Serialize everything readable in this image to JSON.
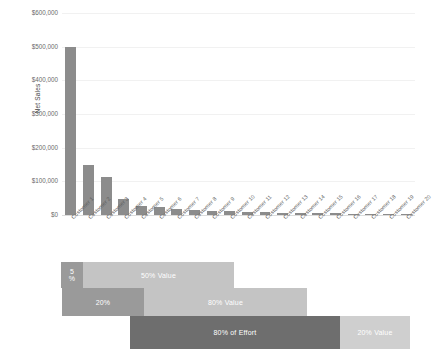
{
  "chart_data": {
    "type": "bar",
    "title": "",
    "xlabel": "",
    "ylabel": "Net Sales",
    "ylim": [
      0,
      600000
    ],
    "grid": true,
    "legend": "none",
    "categories": [
      "Customer 1",
      "Customer 2",
      "Customer 3",
      "Customer 4",
      "Customer 5",
      "Customer 6",
      "Customer 7",
      "Customer 8",
      "Customer 9",
      "Customer 10",
      "Customer 11",
      "Customer 12",
      "Customer 13",
      "Customer 14",
      "Customer 15",
      "Customer 16",
      "Customer 17",
      "Customer 18",
      "Customer 19",
      "Customer 20"
    ],
    "values": [
      500000,
      150000,
      112000,
      48000,
      27000,
      23000,
      18000,
      14000,
      12000,
      11000,
      9000,
      8000,
      7000,
      6500,
      6000,
      5000,
      4500,
      4000,
      3500,
      3000
    ],
    "ytick_labels": [
      "$0",
      "$100,000",
      "$200,000",
      "$300,000",
      "$400,000",
      "$500,000",
      "$600,000"
    ],
    "ytick_values": [
      0,
      100000,
      200000,
      300000,
      400000,
      500000,
      600000
    ],
    "bar_color": "#8c8c8c"
  },
  "pareto": {
    "rows": [
      {
        "name": "row-five-percent",
        "blocks": [
          {
            "label": "5\n%",
            "label_line1": "5",
            "label_line2": "%",
            "tone": "mid",
            "kind": "effort"
          },
          {
            "label": "50% Value",
            "tone": "light",
            "kind": "value"
          }
        ]
      },
      {
        "name": "row-twenty-percent",
        "blocks": [
          {
            "label": "20%",
            "tone": "mid",
            "kind": "effort"
          },
          {
            "label": "80% Value",
            "tone": "light",
            "kind": "value"
          }
        ]
      },
      {
        "name": "row-eighty-percent",
        "blocks": [
          {
            "label": "80% of Effort",
            "tone": "dark",
            "kind": "effort"
          },
          {
            "label": "20% Value",
            "tone": "lighter",
            "kind": "value"
          }
        ]
      }
    ],
    "colors": {
      "dark": "#6e6e6e",
      "mid": "#9a9a9a",
      "light": "#c4c4c4",
      "lighter": "#cfcfcf"
    }
  }
}
